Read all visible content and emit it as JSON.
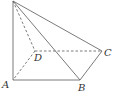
{
  "diagram": {
    "type": "pyramid",
    "line_color": "#6b6b6b",
    "label_color": "#333333",
    "points": {
      "P": {
        "x": 13,
        "y": 1
      },
      "A": {
        "x": 13,
        "y": 80
      },
      "B": {
        "x": 80,
        "y": 80
      },
      "C": {
        "x": 102,
        "y": 51
      },
      "D": {
        "x": 35,
        "y": 51
      }
    },
    "solid_edges": [
      [
        "P",
        "A"
      ],
      [
        "P",
        "B"
      ],
      [
        "P",
        "C"
      ],
      [
        "A",
        "B"
      ],
      [
        "B",
        "C"
      ]
    ],
    "dashed_edges": [
      [
        "P",
        "D"
      ],
      [
        "D",
        "C"
      ],
      [
        "D",
        "A"
      ]
    ],
    "labels": {
      "A": "A",
      "B": "B",
      "C": "C",
      "D": "D"
    }
  }
}
